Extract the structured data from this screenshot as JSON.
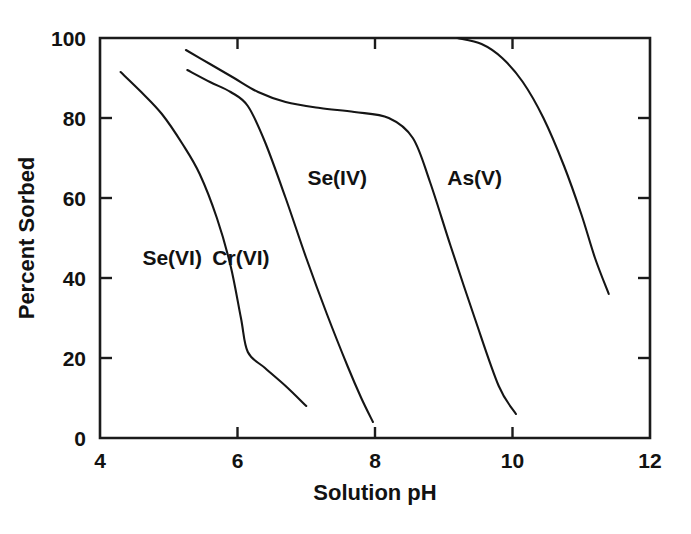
{
  "chart_data": {
    "type": "line",
    "title": "",
    "xlabel": "Solution pH",
    "ylabel": "Percent Sorbed",
    "xlim": [
      4,
      12
    ],
    "ylim": [
      0,
      100
    ],
    "xticks": [
      4,
      6,
      8,
      10,
      12
    ],
    "yticks": [
      0,
      20,
      40,
      60,
      80,
      100
    ],
    "xtick_labels": [
      "4",
      "6",
      "8",
      "10",
      "12"
    ],
    "ytick_labels": [
      "0",
      "20",
      "40",
      "60",
      "80",
      "100"
    ],
    "grid": false,
    "legend_position": "inline-annotations",
    "frame": "box",
    "line_color": "#151515",
    "series": [
      {
        "name": "Se(VI)",
        "label_x": 5.05,
        "label_y": 45,
        "x": [
          4.3,
          4.6,
          4.9,
          5.2,
          5.45,
          5.7,
          5.9,
          6.05,
          6.15,
          6.4,
          6.7,
          7.0
        ],
        "values": [
          91.5,
          86.5,
          81.0,
          73.5,
          66.0,
          55.0,
          43.0,
          30.0,
          21.5,
          17.5,
          13.0,
          8.0
        ]
      },
      {
        "name": "Cr(VI)",
        "label_x": 6.05,
        "label_y": 45,
        "x": [
          5.27,
          5.6,
          5.9,
          6.15,
          6.4,
          6.7,
          7.0,
          7.3,
          7.6,
          7.8,
          7.97
        ],
        "values": [
          92.0,
          89.0,
          86.5,
          83.0,
          74.0,
          60.0,
          45.0,
          31.0,
          18.0,
          10.0,
          4.0
        ]
      },
      {
        "name": "Se(IV)",
        "label_x": 7.45,
        "label_y": 65,
        "x": [
          5.25,
          5.6,
          5.95,
          6.3,
          6.7,
          7.2,
          7.7,
          8.2,
          8.55,
          8.8,
          9.1,
          9.45,
          9.8,
          10.05
        ],
        "values": [
          97.0,
          93.5,
          90.0,
          86.5,
          84.0,
          82.5,
          81.5,
          80.0,
          75.0,
          64.0,
          48.0,
          30.0,
          13.0,
          6.0
        ]
      },
      {
        "name": "As(V)",
        "label_x": 9.45,
        "label_y": 65,
        "x": [
          9.2,
          9.55,
          9.85,
          10.15,
          10.45,
          10.75,
          11.0,
          11.2,
          11.4
        ],
        "values": [
          100.0,
          98.5,
          95.0,
          89.0,
          80.0,
          68.0,
          56.0,
          45.0,
          36.0
        ]
      }
    ]
  }
}
